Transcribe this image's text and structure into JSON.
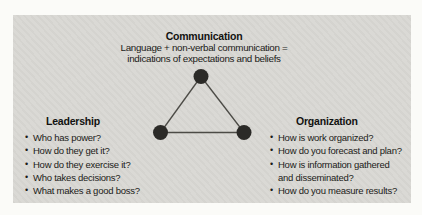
{
  "figure": {
    "communication": {
      "title": "Communication",
      "line1": "Language + non-verbal communication =",
      "line2": "indications of expectations and beliefs"
    },
    "leadership": {
      "title": "Leadership",
      "items": [
        "Who has power?",
        "How do they get it?",
        "How do they exercise it?",
        "Who takes decisions?",
        "What makes a good boss?"
      ]
    },
    "organization": {
      "title": "Organization",
      "items": [
        "How is work organized?",
        "How do you forecast and plan?",
        "How is information gathered\nand disseminated?",
        "How do you measure results?"
      ]
    },
    "bullet_char": "•",
    "colors": {
      "page_bg": "#fbfbf8",
      "panel_bg": "#d9d8d4",
      "node_fill": "#2b2a27",
      "edge_stroke": "#4c4b46",
      "text": "#1b1b18"
    }
  }
}
